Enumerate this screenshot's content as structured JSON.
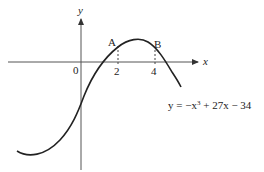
{
  "diagram": {
    "type": "function-graph",
    "axes": {
      "x_label": "x",
      "y_label": "y",
      "origin_label": "0",
      "x_ticks": [
        {
          "value": 2,
          "label": "2"
        },
        {
          "value": 4,
          "label": "4"
        }
      ]
    },
    "points": [
      {
        "name": "A",
        "label": "A",
        "x": 2
      },
      {
        "name": "B",
        "label": "B",
        "x": 4
      }
    ],
    "curve": {
      "equation_prefix": "y = −x",
      "equation_exponent": "3",
      "equation_suffix": " + 27x − 34"
    },
    "colors": {
      "curve": "#222222",
      "axes": "#555555",
      "text": "#222222"
    }
  }
}
